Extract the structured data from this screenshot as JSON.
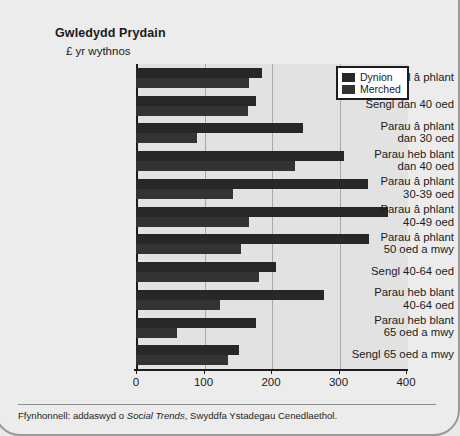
{
  "chart_data": {
    "type": "bar",
    "orientation": "horizontal",
    "title": "Gwledydd Prydain",
    "subtitle": "£ yr wythnos",
    "xlabel": "",
    "ylabel": "",
    "xlim": [
      0,
      400
    ],
    "xticks": [
      "0",
      "100",
      "200",
      "300",
      "400"
    ],
    "grid": "vertical",
    "legend_position": "top-right",
    "categories": [
      "Sengl â phlant",
      "Sengl dan 40 oed",
      "Parau â phlant\ndan 30 oed",
      "Parau heb blant\ndan 40 oed",
      "Parau â phlant\n30-39 oed",
      "Parau â phlant\n40-49 oed",
      "Parau â phlant\n50 oed a mwy",
      "Sengl 40-64 oed",
      "Parau heb blant\n40-64 oed",
      "Parau heb blant\n65 oed a mwy",
      "Sengl 65 oed a mwy"
    ],
    "series": [
      {
        "name": "Dynion",
        "color": "#272727",
        "values": [
          186,
          178,
          248,
          308,
          343,
          373,
          345,
          207,
          278,
          178,
          152
        ]
      },
      {
        "name": "Merched",
        "color": "#333333",
        "values": [
          168,
          166,
          91,
          236,
          144,
          167,
          155,
          182,
          125,
          60,
          137
        ]
      }
    ]
  },
  "footnote": {
    "prefix": "Ffynhonnell: addaswyd o ",
    "italic": "Social Trends",
    "suffix": ", Swyddfa Ystadegau Cenedlaethol."
  }
}
